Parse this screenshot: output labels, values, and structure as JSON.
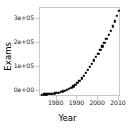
{
  "chart_data": {
    "type": "scatter",
    "title": "",
    "xlabel": "Year",
    "ylabel": "Exams",
    "grid": false,
    "legend": null,
    "xlim": [
      1972,
      2011
    ],
    "ylim": [
      0,
      330000
    ],
    "xticks": [
      1980,
      1990,
      2000,
      2010
    ],
    "xtick_labels": [
      "1980",
      "1990",
      "2000",
      "2010"
    ],
    "yticks": [
      0,
      100000,
      200000,
      300000
    ],
    "ytick_labels": [
      "0e+00",
      "1e+05",
      "2e+05",
      "3e+05"
    ],
    "marker": "filled-square",
    "marker_color": "#000000",
    "x": [
      1973,
      1974,
      1975,
      1976,
      1977,
      1978,
      1979,
      1980,
      1981,
      1982,
      1983,
      1984,
      1985,
      1986,
      1987,
      1988,
      1989,
      1990,
      1991,
      1992,
      1993,
      1994,
      1995,
      1996,
      1997,
      1998,
      1999,
      2000,
      2001,
      2002,
      2003,
      2004,
      2005,
      2006,
      2007,
      2008,
      2009,
      2010
    ],
    "y": [
      9000,
      9500,
      10000,
      10800,
      11500,
      12500,
      13500,
      15000,
      16500,
      18500,
      21000,
      23500,
      26500,
      30000,
      34000,
      39000,
      45000,
      52000,
      60000,
      69000,
      79000,
      90000,
      101000,
      112000,
      124000,
      136000,
      148000,
      161000,
      174000,
      188000,
      202000,
      216000,
      231000,
      246000,
      262000,
      281000,
      300000,
      320000
    ]
  },
  "axis_titles": {
    "x": "Year",
    "y": "Exams"
  }
}
